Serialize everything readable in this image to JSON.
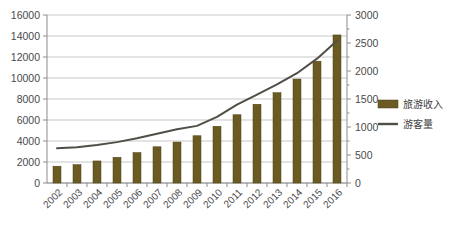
{
  "chart_data": {
    "type": "bar",
    "title": "",
    "subtitle": "",
    "xlabel": "",
    "ylabel": "",
    "y2label": "",
    "grid": true,
    "legend_position": "right",
    "categories": [
      "2002",
      "2003",
      "2004",
      "2005",
      "2006",
      "2007",
      "2008",
      "2009",
      "2010",
      "2011",
      "2012",
      "2013",
      "2014",
      "2015",
      "2016"
    ],
    "yticks": [
      "0",
      "2000",
      "4000",
      "6000",
      "8000",
      "10000",
      "12000",
      "14000",
      "16000"
    ],
    "y2ticks": [
      "0",
      "500",
      "1000",
      "1500",
      "2000",
      "2500",
      "3000"
    ],
    "ylim": [
      0,
      16000
    ],
    "y2lim": [
      0,
      3000
    ],
    "series": [
      {
        "name": "旅游收入",
        "type": "bar",
        "axis": "left",
        "color": "#6b5a22",
        "values": [
          1600,
          1750,
          2100,
          2450,
          2900,
          3450,
          3900,
          4500,
          5400,
          6500,
          7500,
          8600,
          9900,
          11600,
          14100
        ]
      },
      {
        "name": "游客量",
        "type": "line",
        "axis": "right",
        "color": "#4f4f47",
        "values": [
          620,
          640,
          680,
          730,
          800,
          880,
          960,
          1020,
          1180,
          1400,
          1580,
          1760,
          1960,
          2220,
          2540
        ]
      }
    ]
  },
  "legend": {
    "items": [
      {
        "label": "旅游收入",
        "marker": "bar-swatch",
        "color": "#6b5a22"
      },
      {
        "label": "游客量",
        "marker": "line-swatch",
        "color": "#4f4f47"
      }
    ]
  }
}
